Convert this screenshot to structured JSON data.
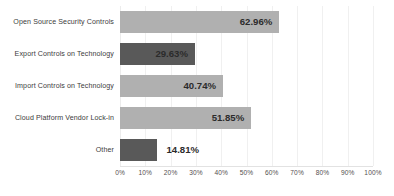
{
  "chart_data": {
    "type": "bar",
    "orientation": "horizontal",
    "title": "",
    "subtitle": "",
    "xlabel": "",
    "ylabel": "",
    "xlim": [
      0,
      100
    ],
    "grid": true,
    "legend": "none",
    "categories": [
      "Open Source Security Controls",
      "Export Controls on Technology",
      "Import Controls on Technology",
      "Cloud Platform Vendor Lock-in",
      "Other"
    ],
    "values": [
      62.96,
      29.63,
      40.74,
      51.85,
      14.81
    ],
    "value_labels": [
      "62.96%",
      "29.63%",
      "40.74%",
      "51.85%",
      "14.81%"
    ],
    "label_position": [
      "inside",
      "inside",
      "inside",
      "inside",
      "outside"
    ],
    "bar_colors": [
      "#b0b0b0",
      "#595959",
      "#b0b0b0",
      "#b0b0b0",
      "#595959"
    ],
    "xticks": [
      0,
      10,
      20,
      30,
      40,
      50,
      60,
      70,
      80,
      90,
      100
    ],
    "xtick_labels": [
      "0%",
      "10%",
      "20%",
      "30%",
      "40%",
      "50%",
      "60%",
      "70%",
      "80%",
      "90%",
      "100%"
    ]
  },
  "style": {
    "background": "#ffffff",
    "gridline_color": "#f0f0f0",
    "axis_line_color": "#e2e2e2",
    "category_label_color": "#3c3c3c",
    "value_label_color": "#2b2b2b",
    "tick_label_color": "#54504f",
    "bar_light": "#b0b0b0",
    "bar_dark": "#595959"
  }
}
